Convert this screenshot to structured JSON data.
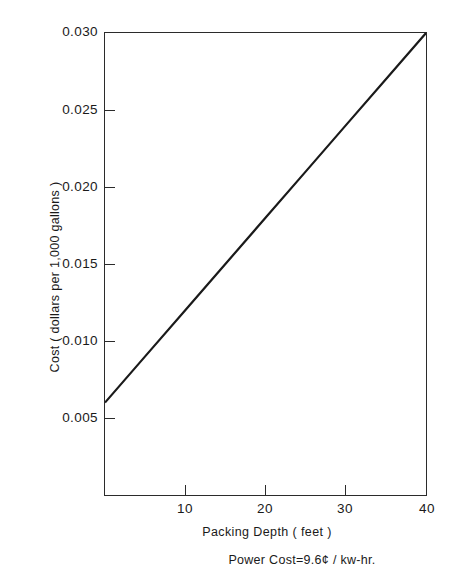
{
  "chart_data": {
    "type": "line",
    "title": "",
    "xlabel": "Packing  Depth ( feet )",
    "ylabel": "Cost ( dollars per 1,000 gallons )",
    "xlim": [
      0,
      40
    ],
    "ylim": [
      0.0,
      0.03
    ],
    "grid": false,
    "legend": null,
    "xticks": [
      10,
      20,
      30,
      40
    ],
    "xtick_labels": [
      "10",
      "20",
      "30",
      "40"
    ],
    "yticks": [
      0.005,
      0.01,
      0.015,
      0.02,
      0.025,
      0.03
    ],
    "ytick_labels": [
      "0.005",
      "0.010",
      "0.015",
      "0.020",
      "0.025",
      "0.030"
    ],
    "series": [
      {
        "name": "Cost vs Packing Depth",
        "color": "#1a1a1a",
        "x": [
          0,
          5,
          10,
          15,
          20,
          25,
          30,
          35,
          40
        ],
        "y": [
          0.006,
          0.009,
          0.012,
          0.015,
          0.018,
          0.021,
          0.024,
          0.027,
          0.03
        ]
      }
    ],
    "annotations": [
      {
        "text": "Power Cost=9.6¢ / kw-hr.",
        "position": "below-axis-right"
      }
    ]
  },
  "axes": {
    "y_title": "Cost ( dollars per 1,000 gallons )",
    "x_title": "Packing  Depth ( feet )",
    "y_tick_labels": [
      "0.030",
      "0.025",
      "0.020",
      "0.015",
      "0.010",
      "0.005"
    ],
    "x_tick_labels": [
      "10",
      "20",
      "30",
      "40"
    ]
  },
  "footnote": {
    "text": "Power Cost=9.6¢ / kw-hr."
  },
  "colors": {
    "line": "#1a1a1a",
    "axis": "#2b2b2b",
    "background": "#ffffff"
  }
}
